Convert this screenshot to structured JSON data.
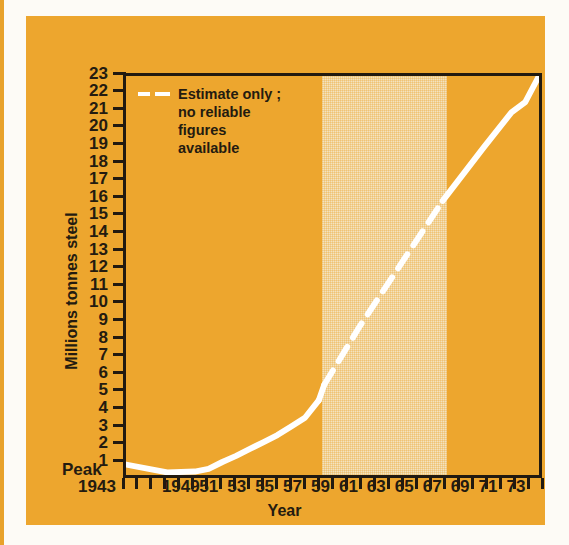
{
  "colors": {
    "panel_orange": "#eda62e",
    "band_shade": "#f3e3c0",
    "line_white": "#ffffff",
    "ink": "#241b10",
    "page_white": "#fdfbf6"
  },
  "legend": {
    "label": "Estimate only ;\nno reliable\nfigures\navailable",
    "style": "dashed-white"
  },
  "axes": {
    "y_title": "Millions tonnes steel",
    "x_title": "Year",
    "peak_label": "Peak",
    "y_labels": [
      "23",
      "22",
      "21",
      "20",
      "19",
      "18",
      "17",
      "16",
      "15",
      "14",
      "13",
      "12",
      "11",
      "10",
      "9",
      "8",
      "7",
      "6",
      "5",
      "4",
      "3",
      "2",
      "1"
    ],
    "x_labels": [
      "1943",
      "1949",
      "51",
      "53",
      "55",
      "57",
      "59",
      "61",
      "63",
      "65",
      "67",
      "69",
      "71",
      "73"
    ],
    "x_label_years": [
      1943,
      1949,
      1951,
      1953,
      1955,
      1957,
      1959,
      1961,
      1963,
      1965,
      1967,
      1969,
      1971,
      1973
    ]
  },
  "chart_data": {
    "type": "line",
    "title": "",
    "xlabel": "Year",
    "ylabel": "Millions tonnes steel",
    "xlim": [
      1943,
      1973
    ],
    "ylim": [
      0,
      23
    ],
    "grid": false,
    "legend_position": "top-left",
    "annotations": [
      {
        "text": "Peak",
        "x": 1943,
        "y": 0,
        "note": "marks pre-war peak baseline at left of x axis"
      },
      {
        "text": "Estimate only ; no reliable figures available",
        "x": 1957,
        "y": 22,
        "note": "legend for the dashed white segment and the shaded band 1957-1966"
      }
    ],
    "shaded_band": {
      "x_start": 1957,
      "x_end": 1966,
      "color": "#f3e3c0",
      "label": "estimate-only period"
    },
    "series": [
      {
        "name": "Steel output",
        "color": "#ffffff",
        "segments": [
          {
            "style": "solid",
            "x": [
              1943,
              1946,
              1948,
              1949,
              1950,
              1951,
              1952,
              1953,
              1954,
              1955,
              1956,
              1957
            ],
            "values": [
              0.6,
              0.15,
              0.2,
              0.35,
              0.75,
              1.1,
              1.5,
              1.9,
              2.3,
              2.8,
              3.3,
              4.3
            ]
          },
          {
            "style": "solid",
            "x": [
              1957,
              1957.4
            ],
            "values": [
              4.3,
              5.2
            ]
          },
          {
            "style": "dashed",
            "x": [
              1957.4,
              1960,
              1963,
              1966
            ],
            "values": [
              5.2,
              8.6,
              12.2,
              15.8
            ]
          },
          {
            "style": "solid",
            "x": [
              1966,
              1969,
              1971,
              1972,
              1973
            ],
            "values": [
              15.8,
              18.9,
              20.9,
              21.5,
              23.0
            ]
          }
        ]
      }
    ]
  }
}
